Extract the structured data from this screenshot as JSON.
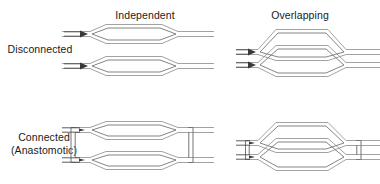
{
  "figure": {
    "width": 380,
    "height": 184,
    "background_color": "#ffffff",
    "vessel_stroke_color": "#8a8a8a",
    "connector_stroke_color": "#757575",
    "arrow_color": "#3a3a3a",
    "text_color": "#1a1a1a"
  },
  "columns": [
    {
      "id": "independent",
      "label": "Independent"
    },
    {
      "id": "overlapping",
      "label": "Overlapping"
    }
  ],
  "rows": [
    {
      "id": "disconnected",
      "label_line1": "Disconnected",
      "label_line2": ""
    },
    {
      "id": "connected",
      "label_line1": "Connected",
      "label_line2": "(Anastomotic)"
    }
  ],
  "panels": [
    {
      "id": "disconnected-independent",
      "row": "disconnected",
      "column": "independent",
      "description": "Two separate lens-shaped vessel loops stacked vertically, each fed by its own inflow arrow, with no cross connections",
      "vessel_count": 2,
      "inflow_arrows": 2,
      "anastomoses": 0,
      "overlap": false
    },
    {
      "id": "disconnected-overlapping",
      "row": "disconnected",
      "column": "overlapping",
      "description": "Two lens-shaped vessel loops whose territories overlap vertically but are not joined, each fed by its own inflow arrow",
      "vessel_count": 2,
      "inflow_arrows": 2,
      "anastomoses": 0,
      "overlap": true
    },
    {
      "id": "connected-independent",
      "row": "connected",
      "column": "independent",
      "description": "Two separate lens-shaped vessel loops joined by vertical anastomotic connectors at the inflow and outflow ends",
      "vessel_count": 2,
      "inflow_arrows": 2,
      "anastomoses": 2,
      "overlap": false
    },
    {
      "id": "connected-overlapping",
      "row": "connected",
      "column": "overlapping",
      "description": "Two overlapping lens-shaped vessel loops joined by vertical anastomotic connectors at the inflow and outflow ends",
      "vessel_count": 2,
      "inflow_arrows": 2,
      "anastomoses": 2,
      "overlap": true
    }
  ]
}
